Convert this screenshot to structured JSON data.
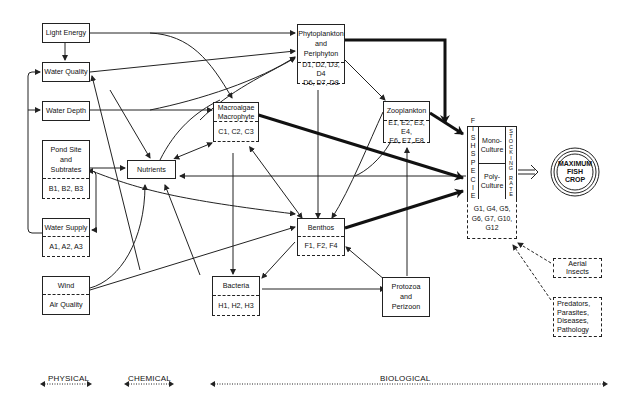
{
  "diagram": {
    "nodes": {
      "light_energy": {
        "label": "Light Energy"
      },
      "water_quality": {
        "label": "Water Quality"
      },
      "water_depth": {
        "label": "Water Depth"
      },
      "pond_site": {
        "label_lines": [
          "Pond Site",
          "and",
          "Subtrates"
        ],
        "codes": "B1, B2, B3"
      },
      "water_supply": {
        "label": "Water Supply",
        "codes": "A1, A2, A3"
      },
      "wind": {
        "label": "Wind",
        "sub_label": "Air Quality"
      },
      "nutrients": {
        "label": "Nutrients"
      },
      "phytoplankton": {
        "label_lines": [
          "Phytoplankton",
          "and",
          "Periphyton"
        ],
        "codes_lines": [
          "D1, D2, D3, D4",
          "D6, D7, D8"
        ]
      },
      "macroalgae": {
        "label_lines": [
          "Macroalgae",
          "Macrophyte"
        ],
        "codes": "C1, C2, C3"
      },
      "zooplankton": {
        "label": "Zooplankton",
        "codes_lines": [
          "E1, E2, E3, E4,",
          "E6, E7, E8"
        ]
      },
      "benthos": {
        "label": "Benthos",
        "codes": "F1, F2, F4"
      },
      "bacteria": {
        "label": "Bacteria",
        "codes": "H1, H2, H3"
      },
      "protozoa": {
        "label_lines": [
          "Protozoa",
          "and",
          "Perizoon"
        ]
      },
      "fish": {
        "left_vertical": [
          "F",
          "I",
          "S",
          "H",
          "",
          "S",
          "P",
          "E",
          "C",
          "I",
          "E",
          "S"
        ],
        "right_vertical": [
          "S",
          "T",
          "O",
          "C",
          "K",
          "I",
          "N",
          "G",
          "",
          "R",
          "A",
          "T",
          "E"
        ],
        "mono_lines": [
          "Mono-",
          "Culture"
        ],
        "poly_lines": [
          "Poly-",
          "Culture"
        ],
        "codes_lines": [
          "G1, G4, G5,",
          "G6, G7, G10,",
          "G12"
        ]
      },
      "aerial_insects": {
        "label_lines": [
          "Aerial",
          "Insects"
        ]
      },
      "predators": {
        "label_lines": [
          "Predators,",
          "Parasites,",
          "Diseases,",
          "Pathology"
        ]
      },
      "max_crop": {
        "label_lines": [
          "MAXIMUM",
          "FISH",
          "CROP"
        ]
      }
    },
    "scale": {
      "physical": "PHYSICAL",
      "chemical": "CHEMICAL",
      "biological": "BIOLOGICAL"
    },
    "colors": {
      "line": "#222222",
      "background": "#ffffff"
    }
  }
}
